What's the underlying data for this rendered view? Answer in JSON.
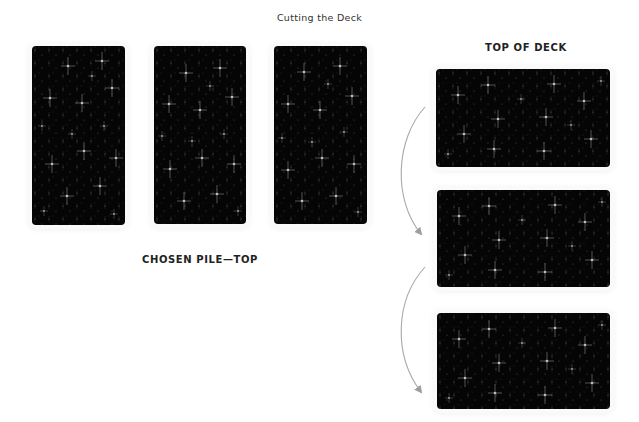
{
  "title": "Cutting the Deck",
  "labels": {
    "chosen_pile": "CHOSEN PILE—TOP",
    "top_of_deck": "TOP OF DECK"
  },
  "piles": [
    {
      "name": "pile-1",
      "orientation": "portrait"
    },
    {
      "name": "pile-2",
      "orientation": "portrait"
    },
    {
      "name": "pile-3",
      "orientation": "portrait"
    }
  ],
  "stack": [
    {
      "name": "stack-card-top",
      "orientation": "landscape"
    },
    {
      "name": "stack-card-middle",
      "orientation": "landscape"
    },
    {
      "name": "stack-card-bottom",
      "orientation": "landscape"
    }
  ],
  "colors": {
    "card_back": "#050505",
    "star": "#9a9a9a",
    "arrow": "#9e9e9e",
    "text": "#222222"
  }
}
